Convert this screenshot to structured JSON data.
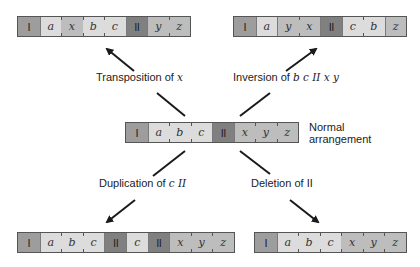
{
  "chromosomes": {
    "transposition": {
      "segments": [
        "I",
        "a",
        "x",
        "b",
        "c",
        "II",
        "y",
        "z"
      ]
    },
    "inversion": {
      "segments": [
        "I",
        "a",
        "y",
        "x",
        "II",
        "c",
        "b",
        "z"
      ]
    },
    "normal": {
      "segments": [
        "I",
        "a",
        "b",
        "c",
        "II",
        "x",
        "y",
        "z"
      ],
      "label_line1": "Normal",
      "label_line2": "arrangement"
    },
    "duplication": {
      "segments": [
        "I",
        "a",
        "b",
        "c",
        "II",
        "c",
        "II",
        "x",
        "y",
        "z"
      ]
    },
    "deletion": {
      "segments": [
        "I",
        "a",
        "b",
        "c",
        "x",
        "y",
        "z"
      ]
    }
  },
  "labels": {
    "transposition_prefix": "Transposition of ",
    "transposition_target": "x",
    "inversion_prefix": "Inversion of ",
    "inversion_target": "b c II x y",
    "duplication_prefix": "Duplication of ",
    "duplication_target": "c II",
    "deletion_text": "Deletion of II"
  },
  "colors": {
    "centromere_I": "#9d9d9d",
    "arm_abc": "#dcdcdc",
    "arm_xyz": "#bdbdbd",
    "centromere_II": "#808080",
    "arrow": "#1a1a1a"
  }
}
